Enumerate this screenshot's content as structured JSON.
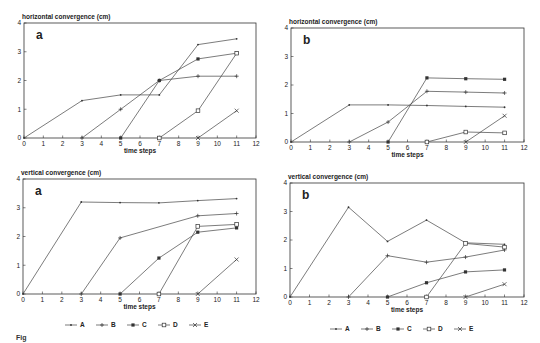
{
  "chart_data": [
    {
      "id": "horiz-a",
      "type": "line",
      "panel_label": "a",
      "title": "horizontal convergence (cm)",
      "xlabel": "time steps",
      "ylabel": "horizontal convergence (cm)",
      "xlim": [
        0,
        12
      ],
      "ylim": [
        0,
        4
      ],
      "xticks": [
        0,
        1,
        2,
        3,
        4,
        5,
        6,
        7,
        8,
        9,
        10,
        11,
        12
      ],
      "yticks": [
        0,
        1,
        2,
        3,
        4
      ],
      "frame": {
        "x0": 24,
        "x1": 256,
        "y0": 138,
        "y1": 23
      },
      "series": [
        {
          "name": "A",
          "marker": "dot",
          "x": [
            0,
            3,
            5,
            7,
            9,
            11
          ],
          "y": [
            0,
            1.3,
            1.5,
            1.5,
            3.25,
            3.45
          ]
        },
        {
          "name": "B",
          "marker": "plus",
          "x": [
            3,
            5,
            7,
            9,
            11
          ],
          "y": [
            0,
            1.0,
            2.0,
            2.15,
            2.15
          ]
        },
        {
          "name": "C",
          "marker": "star",
          "x": [
            5,
            7,
            9,
            11
          ],
          "y": [
            0,
            2.0,
            2.75,
            2.95
          ]
        },
        {
          "name": "D",
          "marker": "square",
          "x": [
            7,
            9,
            11
          ],
          "y": [
            0,
            0.95,
            2.95
          ]
        },
        {
          "name": "E",
          "marker": "cross",
          "x": [
            9,
            11
          ],
          "y": [
            0,
            0.95
          ]
        }
      ]
    },
    {
      "id": "horiz-b",
      "type": "line",
      "panel_label": "b",
      "title": "horizontal convergence (cm)",
      "xlabel": "time steps",
      "ylabel": "horizontal convergence (cm)",
      "xlim": [
        0,
        12
      ],
      "ylim": [
        0,
        4
      ],
      "xticks": [
        0,
        1,
        2,
        3,
        4,
        5,
        6,
        7,
        8,
        9,
        10,
        11,
        12
      ],
      "yticks": [
        0,
        1,
        2,
        3,
        4
      ],
      "frame": {
        "x0": 291,
        "x1": 524,
        "y0": 142,
        "y1": 28
      },
      "series": [
        {
          "name": "A",
          "marker": "dot",
          "x": [
            0,
            3,
            5,
            7,
            9,
            11
          ],
          "y": [
            0,
            1.3,
            1.3,
            1.28,
            1.25,
            1.22
          ]
        },
        {
          "name": "B",
          "marker": "plus",
          "x": [
            3,
            5,
            7,
            9,
            11
          ],
          "y": [
            0,
            0.7,
            1.78,
            1.75,
            1.72
          ]
        },
        {
          "name": "C",
          "marker": "star",
          "x": [
            5,
            7,
            9,
            11
          ],
          "y": [
            0,
            2.25,
            2.22,
            2.2
          ]
        },
        {
          "name": "D",
          "marker": "square",
          "x": [
            7,
            9,
            11
          ],
          "y": [
            0,
            0.35,
            0.32
          ]
        },
        {
          "name": "E",
          "marker": "cross",
          "x": [
            9,
            11
          ],
          "y": [
            0,
            0.92
          ]
        }
      ]
    },
    {
      "id": "vert-a",
      "type": "line",
      "panel_label": "a",
      "title": "vertical convergence (cm)",
      "xlabel": "time steps",
      "ylabel": "vertical convergence (cm)",
      "xlim": [
        0,
        12
      ],
      "ylim": [
        0,
        4
      ],
      "xticks": [
        0,
        1,
        2,
        3,
        4,
        5,
        6,
        7,
        8,
        9,
        10,
        11,
        12
      ],
      "yticks": [
        0,
        1,
        2,
        3,
        4
      ],
      "frame": {
        "x0": 23,
        "x1": 256,
        "y0": 294,
        "y1": 179
      },
      "series": [
        {
          "name": "A",
          "marker": "dot",
          "x": [
            0,
            3,
            5,
            7,
            9,
            11
          ],
          "y": [
            0,
            3.2,
            3.18,
            3.17,
            3.25,
            3.32
          ]
        },
        {
          "name": "B",
          "marker": "plus",
          "x": [
            3,
            5,
            9,
            11
          ],
          "y": [
            0,
            1.95,
            2.72,
            2.8
          ]
        },
        {
          "name": "C",
          "marker": "star",
          "x": [
            5,
            7,
            9,
            11
          ],
          "y": [
            0,
            1.25,
            2.15,
            2.3
          ]
        },
        {
          "name": "D",
          "marker": "square",
          "x": [
            7,
            9,
            11
          ],
          "y": [
            0,
            2.35,
            2.42
          ]
        },
        {
          "name": "E",
          "marker": "cross",
          "x": [
            9,
            11
          ],
          "y": [
            0,
            1.2
          ]
        }
      ]
    },
    {
      "id": "vert-b",
      "type": "line",
      "panel_label": "b",
      "title": "vertical convergence (cm)",
      "xlabel": "time steps",
      "ylabel": "vertical convergence (cm)",
      "xlim": [
        0,
        12
      ],
      "ylim": [
        0,
        4
      ],
      "xticks": [
        0,
        1,
        2,
        3,
        4,
        5,
        6,
        7,
        8,
        9,
        10,
        11,
        12
      ],
      "yticks": [
        0,
        1,
        2,
        3,
        4
      ],
      "frame": {
        "x0": 290,
        "x1": 524,
        "y0": 297,
        "y1": 183
      },
      "series": [
        {
          "name": "A",
          "marker": "dot",
          "x": [
            0,
            3,
            5,
            7,
            9,
            11
          ],
          "y": [
            0,
            3.15,
            1.95,
            2.7,
            1.9,
            1.85
          ]
        },
        {
          "name": "B",
          "marker": "plus",
          "x": [
            3,
            5,
            7,
            9,
            11
          ],
          "y": [
            0,
            1.45,
            1.22,
            1.4,
            1.65
          ]
        },
        {
          "name": "C",
          "marker": "star",
          "x": [
            5,
            7,
            9,
            11
          ],
          "y": [
            0,
            0.5,
            0.88,
            0.95
          ]
        },
        {
          "name": "D",
          "marker": "square",
          "x": [
            7,
            9,
            11
          ],
          "y": [
            0,
            1.88,
            1.75
          ]
        },
        {
          "name": "E",
          "marker": "cross",
          "x": [
            9,
            11
          ],
          "y": [
            0,
            0.45
          ]
        }
      ]
    }
  ],
  "legends": [
    {
      "id": "legend-left",
      "x": 65,
      "y": 325,
      "items": [
        "A",
        "B",
        "C",
        "D",
        "E"
      ],
      "markers": [
        "dot",
        "plus",
        "star",
        "square",
        "cross"
      ]
    },
    {
      "id": "legend-right",
      "x": 330,
      "y": 329,
      "items": [
        "A",
        "B",
        "C",
        "D",
        "E"
      ],
      "markers": [
        "dot",
        "plus",
        "star",
        "square",
        "cross"
      ]
    }
  ],
  "caption": "Fig"
}
